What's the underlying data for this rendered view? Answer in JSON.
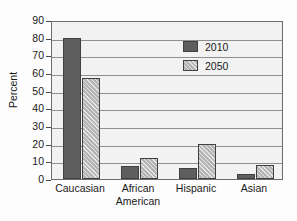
{
  "chart_data": {
    "type": "bar",
    "title": "",
    "xlabel": "",
    "ylabel": "Percent",
    "ylim": [
      0,
      90
    ],
    "ytick_step": 10,
    "yticks": [
      90,
      80,
      70,
      60,
      50,
      40,
      30,
      20,
      10,
      0
    ],
    "grid": true,
    "legend_position": "upper-right-inside",
    "categories": [
      "Caucasian",
      "African American",
      "Hispanic",
      "Asian"
    ],
    "category_lines": [
      [
        "Caucasian"
      ],
      [
        "African",
        "American"
      ],
      [
        "Hispanic"
      ],
      [
        "Asian"
      ]
    ],
    "series": [
      {
        "name": "2010",
        "color": "#5e5e5e",
        "fill": "solid",
        "values": [
          80,
          7.5,
          6,
          3
        ]
      },
      {
        "name": "2050",
        "color": "#b4b4b4",
        "fill": "diagonal-hatch",
        "values": [
          57,
          12,
          20,
          8
        ]
      }
    ]
  }
}
